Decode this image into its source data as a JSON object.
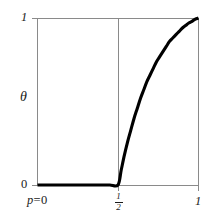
{
  "chart_data": {
    "type": "line",
    "title": "",
    "subtitle": "",
    "xlabel": "p",
    "ylabel": "θ",
    "xlim": [
      0,
      1
    ],
    "ylim": [
      0,
      1
    ],
    "grid": true,
    "legend": null,
    "x_ticks": [
      {
        "value": 0,
        "label": "p = 0"
      },
      {
        "value": 0.5,
        "label": "1/2",
        "numerator": "1",
        "denominator": "2"
      },
      {
        "value": 1,
        "label": "1"
      }
    ],
    "y_ticks": [
      {
        "value": 0,
        "label": "0"
      },
      {
        "value": 1,
        "label": "1"
      }
    ],
    "gridlines": {
      "horizontal": [
        1
      ],
      "vertical": [
        0,
        0.5,
        1
      ]
    },
    "series": [
      {
        "name": "theta(p)",
        "color": "#000000",
        "linewidth": 3,
        "x": [
          0.0,
          0.05,
          0.1,
          0.15,
          0.2,
          0.25,
          0.3,
          0.35,
          0.4,
          0.45,
          0.5,
          0.52,
          0.54,
          0.56,
          0.58,
          0.6,
          0.62,
          0.64,
          0.66,
          0.68,
          0.7,
          0.72,
          0.74,
          0.76,
          0.78,
          0.8,
          0.82,
          0.84,
          0.86,
          0.88,
          0.9,
          0.92,
          0.94,
          0.96,
          0.98,
          1.0
        ],
        "y": [
          0.0,
          0.0,
          0.0,
          0.0,
          0.0,
          0.0,
          0.0,
          0.0,
          0.0,
          0.0,
          0.0,
          0.09,
          0.18,
          0.26,
          0.33,
          0.4,
          0.46,
          0.52,
          0.57,
          0.62,
          0.66,
          0.7,
          0.74,
          0.77,
          0.8,
          0.83,
          0.86,
          0.88,
          0.9,
          0.92,
          0.94,
          0.955,
          0.97,
          0.98,
          0.993,
          1.0
        ]
      }
    ],
    "annotations": []
  },
  "colors": {
    "background": "#ffffff",
    "curve": "#000000",
    "gridline": "#8a8a8a",
    "text": "#1a1a1a"
  },
  "labels": {
    "y_top": "1",
    "y_bottom": "0",
    "y_axis_symbol": "θ",
    "x_left_variable": "p",
    "x_left_equals": "=",
    "x_left_value": "0",
    "x_mid_numerator": "1",
    "x_mid_denominator": "2",
    "x_right": "1"
  }
}
